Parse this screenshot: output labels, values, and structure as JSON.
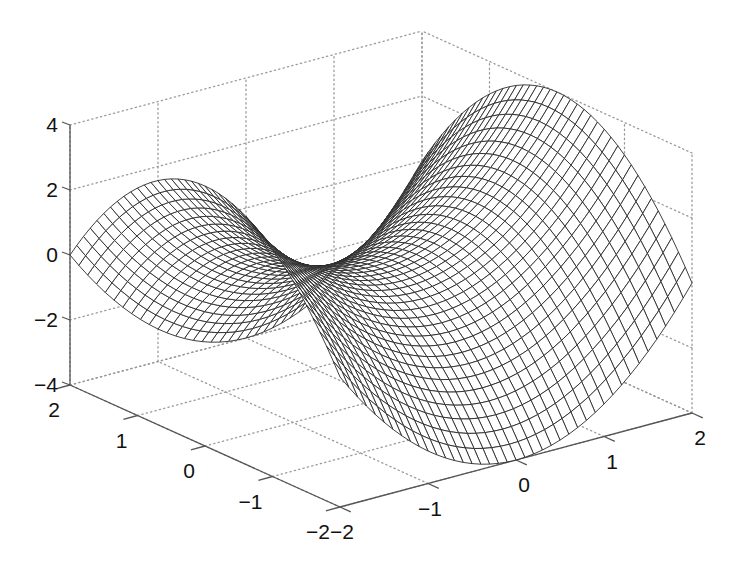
{
  "chart_data": {
    "type": "surface-mesh",
    "title": "",
    "function": "z = x^2 - y^2",
    "x": {
      "label": "",
      "range": [
        -2,
        2
      ],
      "ticks": [
        -2,
        -1,
        0,
        1,
        2
      ],
      "tick_labels": [
        "−2",
        "−1",
        "0",
        "1",
        "2"
      ],
      "axis_position": "front-right"
    },
    "y": {
      "label": "",
      "range": [
        -2,
        2
      ],
      "ticks": [
        -2,
        -1,
        0,
        1,
        2
      ],
      "tick_labels": [
        "−2",
        "−1",
        "0",
        "1",
        "2"
      ],
      "axis_position": "front-left"
    },
    "z": {
      "label": "",
      "range": [
        -4,
        4
      ],
      "ticks": [
        -4,
        -2,
        0,
        2,
        4
      ],
      "tick_labels": [
        "−4",
        "−2",
        "0",
        "2",
        "4"
      ],
      "axis_position": "left-vertical"
    },
    "grid": true,
    "grid_style": "dotted",
    "mesh_resolution": 41,
    "mesh_color": "#2a2a2a",
    "face_color": "#ffffff",
    "axis_color": "#555555",
    "grid_color": "#9a9a9a",
    "sample_points": [
      {
        "x": -2,
        "y": -2,
        "z": 0
      },
      {
        "x": -2,
        "y": 0,
        "z": 4
      },
      {
        "x": -2,
        "y": 2,
        "z": 0
      },
      {
        "x": 0,
        "y": -2,
        "z": -4
      },
      {
        "x": 0,
        "y": 0,
        "z": 0
      },
      {
        "x": 0,
        "y": 2,
        "z": -4
      },
      {
        "x": 2,
        "y": -2,
        "z": 0
      },
      {
        "x": 2,
        "y": 0,
        "z": 4
      },
      {
        "x": 2,
        "y": 2,
        "z": 0
      }
    ],
    "legend": null
  },
  "projection": {
    "front_corner": [
      340,
      507
    ],
    "left_corner": [
      70,
      385
    ],
    "right_corner": [
      692,
      413
    ],
    "z_pixels_per_unit": 32.5
  }
}
